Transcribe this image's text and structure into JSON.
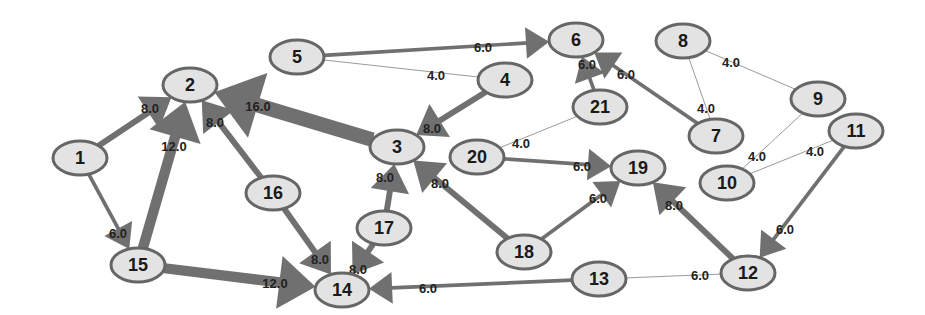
{
  "diagram": {
    "type": "weighted-directed-graph",
    "colors": {
      "node_fill": "#e3e3e3",
      "node_stroke": "#666666",
      "edge": "#707070",
      "thin_edge": "#9a9a9a",
      "text": "#1a1a1a",
      "background": "#ffffff"
    },
    "nodes": [
      {
        "id": "1",
        "label": "1",
        "x": 80,
        "y": 158
      },
      {
        "id": "2",
        "label": "2",
        "x": 190,
        "y": 85
      },
      {
        "id": "3",
        "label": "3",
        "x": 397,
        "y": 147
      },
      {
        "id": "4",
        "label": "4",
        "x": 505,
        "y": 80
      },
      {
        "id": "5",
        "label": "5",
        "x": 297,
        "y": 57
      },
      {
        "id": "6",
        "label": "6",
        "x": 576,
        "y": 40
      },
      {
        "id": "7",
        "label": "7",
        "x": 716,
        "y": 136
      },
      {
        "id": "8",
        "label": "8",
        "x": 683,
        "y": 41
      },
      {
        "id": "9",
        "label": "9",
        "x": 818,
        "y": 99
      },
      {
        "id": "10",
        "label": "10",
        "x": 727,
        "y": 183
      },
      {
        "id": "11",
        "label": "11",
        "x": 856,
        "y": 131
      },
      {
        "id": "12",
        "label": "12",
        "x": 748,
        "y": 273
      },
      {
        "id": "13",
        "label": "13",
        "x": 599,
        "y": 279
      },
      {
        "id": "14",
        "label": "14",
        "x": 342,
        "y": 290
      },
      {
        "id": "15",
        "label": "15",
        "x": 138,
        "y": 265
      },
      {
        "id": "16",
        "label": "16",
        "x": 273,
        "y": 193
      },
      {
        "id": "17",
        "label": "17",
        "x": 384,
        "y": 228
      },
      {
        "id": "18",
        "label": "18",
        "x": 524,
        "y": 252
      },
      {
        "id": "19",
        "label": "19",
        "x": 638,
        "y": 168
      },
      {
        "id": "20",
        "label": "20",
        "x": 477,
        "y": 157
      },
      {
        "id": "21",
        "label": "21",
        "x": 600,
        "y": 107
      }
    ],
    "edges": [
      {
        "from": "1",
        "to": "2",
        "weight": "8.0",
        "directed": true,
        "lx": 150,
        "ly": 110
      },
      {
        "from": "1",
        "to": "15",
        "weight": "6.0",
        "directed": true,
        "lx": 118,
        "ly": 235
      },
      {
        "from": "15",
        "to": "2",
        "weight": "12.0",
        "directed": true,
        "lx": 174,
        "ly": 148
      },
      {
        "from": "16",
        "to": "2",
        "weight": "8.0",
        "directed": true,
        "lx": 215,
        "ly": 124
      },
      {
        "from": "3",
        "to": "2",
        "weight": "16.0",
        "directed": true,
        "lx": 258,
        "ly": 108
      },
      {
        "from": "4",
        "to": "3",
        "weight": "8.0",
        "directed": true,
        "lx": 432,
        "ly": 130
      },
      {
        "from": "5",
        "to": "6",
        "weight": "6.0",
        "directed": true,
        "lx": 483,
        "ly": 49
      },
      {
        "from": "5",
        "to": "4",
        "weight": "4.0",
        "directed": false,
        "lx": 436,
        "ly": 77
      },
      {
        "from": "21",
        "to": "6",
        "weight": "6.0",
        "directed": true,
        "lx": 587,
        "ly": 66
      },
      {
        "from": "7",
        "to": "6",
        "weight": "6.0",
        "directed": true,
        "lx": 626,
        "ly": 76
      },
      {
        "from": "8",
        "to": "7",
        "weight": "4.0",
        "directed": false,
        "lx": 706,
        "ly": 110
      },
      {
        "from": "8",
        "to": "9",
        "weight": "4.0",
        "directed": false,
        "lx": 731,
        "ly": 64
      },
      {
        "from": "21",
        "to": "20",
        "weight": "4.0",
        "directed": false,
        "lx": 521,
        "ly": 145
      },
      {
        "from": "9",
        "to": "10",
        "weight": "4.0",
        "directed": false,
        "lx": 757,
        "ly": 158
      },
      {
        "from": "11",
        "to": "10",
        "weight": "4.0",
        "directed": false,
        "lx": 815,
        "ly": 153
      },
      {
        "from": "20",
        "to": "19",
        "weight": "6.0",
        "directed": true,
        "lx": 582,
        "ly": 168
      },
      {
        "from": "17",
        "to": "3",
        "weight": "8.0",
        "directed": true,
        "lx": 385,
        "ly": 179
      },
      {
        "from": "18",
        "to": "3",
        "weight": "8.0",
        "directed": true,
        "lx": 440,
        "ly": 185
      },
      {
        "from": "18",
        "to": "19",
        "weight": "6.0",
        "directed": true,
        "lx": 598,
        "ly": 200
      },
      {
        "from": "12",
        "to": "19",
        "weight": "8.0",
        "directed": true,
        "lx": 674,
        "ly": 207
      },
      {
        "from": "11",
        "to": "12",
        "weight": "6.0",
        "directed": true,
        "lx": 785,
        "ly": 231
      },
      {
        "from": "13",
        "to": "12",
        "weight": "6.0",
        "directed": false,
        "lx": 700,
        "ly": 277
      },
      {
        "from": "13",
        "to": "14",
        "weight": "6.0",
        "directed": true,
        "lx": 428,
        "ly": 290
      },
      {
        "from": "15",
        "to": "14",
        "weight": "12.0",
        "directed": true,
        "lx": 275,
        "ly": 285
      },
      {
        "from": "16",
        "to": "14",
        "weight": "8.0",
        "directed": true,
        "lx": 320,
        "ly": 261
      },
      {
        "from": "17",
        "to": "14",
        "weight": "8.0",
        "directed": true,
        "lx": 358,
        "ly": 271
      }
    ]
  }
}
